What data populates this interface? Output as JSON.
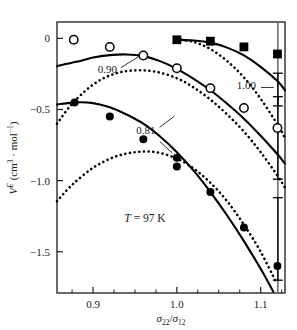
{
  "chart_data": {
    "type": "scatter",
    "title": "",
    "xlabel": "σ22/σ12",
    "ylabel": "VE (cm3 · mol−1)",
    "xlim": [
      0.857,
      1.129
    ],
    "ylim": [
      -1.79,
      0.115
    ],
    "grid": false,
    "legend_position": "inline-labels",
    "annotations": [
      {
        "name": "temperature",
        "text": "T = 97 K",
        "x": 0.962,
        "y": -1.29
      },
      {
        "name": "curve-label-090",
        "text": "0.90",
        "x": 0.917,
        "y": -0.245
      },
      {
        "name": "curve-label-081",
        "text": "0.81",
        "x": 0.963,
        "y": -0.675
      },
      {
        "name": "curve-label-100",
        "text": "1.00",
        "x": 1.083,
        "y": -0.355
      }
    ],
    "xticks": [
      0.9,
      1.0,
      1.1
    ],
    "xtick_labels": [
      "0.9",
      "1.0",
      "1.1"
    ],
    "yticks": [
      0,
      -0.5,
      -1.0,
      -1.5
    ],
    "ytick_labels": [
      "0",
      "−0.5",
      "−1.0",
      "−1.5"
    ],
    "xminor": [
      0.875,
      0.925,
      0.95,
      0.975,
      1.025,
      1.05,
      1.075,
      1.125
    ],
    "series": [
      {
        "name": "1.00",
        "marker": "filled-square",
        "color": "#000000",
        "x": [
          1.0,
          1.04,
          1.08,
          1.12
        ],
        "values": [
          -0.01,
          -0.02,
          -0.06,
          -0.11
        ]
      },
      {
        "name": "0.90",
        "marker": "open-circle",
        "color": "#000000",
        "x": [
          0.877,
          0.92,
          0.96,
          1.0,
          1.04,
          1.08,
          1.12
        ],
        "values": [
          -0.01,
          -0.06,
          -0.12,
          -0.21,
          -0.35,
          -0.49,
          -0.63
        ]
      },
      {
        "name": "0.81",
        "marker": "filled-circle",
        "color": "#000000",
        "x": [
          0.878,
          0.92,
          0.96,
          1.0,
          1.0,
          1.04,
          1.08,
          1.12
        ],
        "values": [
          -0.45,
          -0.55,
          -0.71,
          -0.84,
          -0.9,
          -1.08,
          -1.33,
          -1.6
        ]
      }
    ],
    "solid_curves": [
      {
        "name": "solid-curve-100",
        "points": [
          [
            1.0,
            -0.01
          ],
          [
            1.02,
            -0.015
          ],
          [
            1.04,
            -0.03
          ],
          [
            1.06,
            -0.065
          ],
          [
            1.08,
            -0.12
          ],
          [
            1.1,
            -0.2
          ],
          [
            1.12,
            -0.3
          ],
          [
            1.129,
            -0.365
          ]
        ]
      },
      {
        "name": "solid-curve-090",
        "points": [
          [
            0.857,
            -0.195
          ],
          [
            0.88,
            -0.165
          ],
          [
            0.9,
            -0.135
          ],
          [
            0.92,
            -0.118
          ],
          [
            0.94,
            -0.113
          ],
          [
            0.96,
            -0.125
          ],
          [
            0.98,
            -0.16
          ],
          [
            1.0,
            -0.215
          ],
          [
            1.02,
            -0.285
          ],
          [
            1.04,
            -0.365
          ],
          [
            1.06,
            -0.46
          ],
          [
            1.08,
            -0.565
          ],
          [
            1.1,
            -0.685
          ],
          [
            1.12,
            -0.815
          ],
          [
            1.129,
            -0.88
          ]
        ]
      },
      {
        "name": "solid-curve-081",
        "points": [
          [
            0.857,
            -0.465
          ],
          [
            0.88,
            -0.45
          ],
          [
            0.9,
            -0.455
          ],
          [
            0.92,
            -0.485
          ],
          [
            0.94,
            -0.535
          ],
          [
            0.96,
            -0.6
          ],
          [
            0.98,
            -0.69
          ],
          [
            1.0,
            -0.8
          ],
          [
            1.02,
            -0.93
          ],
          [
            1.04,
            -1.08
          ],
          [
            1.06,
            -1.245
          ],
          [
            1.08,
            -1.425
          ],
          [
            1.1,
            -1.62
          ],
          [
            1.115,
            -1.78
          ]
        ]
      }
    ],
    "dotted_curves": [
      {
        "name": "dotted-curve-100",
        "points": [
          [
            1.0,
            -0.005
          ],
          [
            1.02,
            -0.025
          ],
          [
            1.04,
            -0.075
          ],
          [
            1.06,
            -0.16
          ],
          [
            1.08,
            -0.275
          ],
          [
            1.1,
            -0.425
          ],
          [
            1.12,
            -0.605
          ],
          [
            1.129,
            -0.7
          ]
        ]
      },
      {
        "name": "dotted-curve-090",
        "points": [
          [
            0.857,
            -0.6
          ],
          [
            0.875,
            -0.46
          ],
          [
            0.9,
            -0.325
          ],
          [
            0.925,
            -0.25
          ],
          [
            0.95,
            -0.225
          ],
          [
            0.975,
            -0.235
          ],
          [
            1.0,
            -0.28
          ],
          [
            1.02,
            -0.345
          ],
          [
            1.04,
            -0.43
          ],
          [
            1.06,
            -0.535
          ],
          [
            1.08,
            -0.655
          ],
          [
            1.1,
            -0.8
          ],
          [
            1.12,
            -0.965
          ],
          [
            1.129,
            -1.05
          ]
        ]
      },
      {
        "name": "dotted-curve-081",
        "points": [
          [
            0.857,
            -1.145
          ],
          [
            0.875,
            -1.03
          ],
          [
            0.9,
            -0.91
          ],
          [
            0.925,
            -0.835
          ],
          [
            0.95,
            -0.8
          ],
          [
            0.975,
            -0.8
          ],
          [
            1.0,
            -0.845
          ],
          [
            1.02,
            -0.915
          ],
          [
            1.04,
            -1.015
          ],
          [
            1.06,
            -1.145
          ],
          [
            1.08,
            -1.31
          ],
          [
            1.1,
            -1.5
          ],
          [
            1.118,
            -1.71
          ]
        ]
      }
    ],
    "error_bars": [
      {
        "name": "error-bar-top",
        "x": 1.1205,
        "y": -0.36,
        "half_height": 0.115
      },
      {
        "name": "error-bar-middle",
        "x": 1.1205,
        "y": -0.7,
        "half_height": 0.29
      },
      {
        "name": "error-bar-bottom",
        "x": 1.1205,
        "y": -1.41,
        "half_height": 0.29
      }
    ],
    "vertical_line": {
      "name": "vertical-reference-line",
      "x": 1.1205
    }
  },
  "axes": {
    "y_label_parts": {
      "v": "V",
      "sup_e": "E",
      "open": "(cm",
      "sup3": "3",
      "dot": "·",
      "mol": "mol",
      "sup_m1": "−1",
      "close": ")"
    },
    "x_label_parts": {
      "sigma1": "σ",
      "sub1": "22",
      "slash": "/",
      "sigma2": "σ",
      "sub2": "12"
    }
  }
}
